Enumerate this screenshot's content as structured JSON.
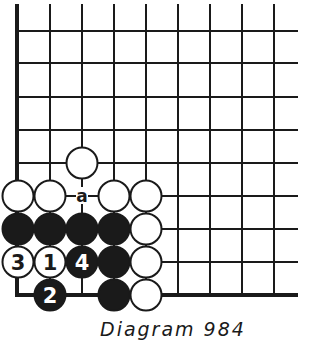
{
  "diagram": {
    "caption": "Diagram 984",
    "colors": {
      "ink": "#1a1a1a",
      "paper": "#ffffff"
    },
    "grid": {
      "x_lines": [
        17,
        50,
        82,
        114,
        146,
        178,
        210,
        242,
        274
      ],
      "y_lines": [
        31,
        63,
        97,
        130,
        163,
        196,
        229,
        262,
        295
      ],
      "top": 4,
      "right": 298,
      "left_edge_x": 17,
      "bottom_edge_y": 295
    },
    "stone_radius": 16,
    "stones": [
      {
        "color": "white",
        "col": 2,
        "row": 4,
        "label": ""
      },
      {
        "color": "white",
        "col": 0,
        "row": 5,
        "label": ""
      },
      {
        "color": "white",
        "col": 1,
        "row": 5,
        "label": ""
      },
      {
        "color": "white",
        "col": 3,
        "row": 5,
        "label": ""
      },
      {
        "color": "white",
        "col": 4,
        "row": 5,
        "label": ""
      },
      {
        "color": "black",
        "col": 0,
        "row": 6,
        "label": ""
      },
      {
        "color": "black",
        "col": 1,
        "row": 6,
        "label": ""
      },
      {
        "color": "black",
        "col": 2,
        "row": 6,
        "label": ""
      },
      {
        "color": "black",
        "col": 3,
        "row": 6,
        "label": ""
      },
      {
        "color": "white",
        "col": 4,
        "row": 6,
        "label": ""
      },
      {
        "color": "white",
        "col": 0,
        "row": 7,
        "label": "3"
      },
      {
        "color": "white",
        "col": 1,
        "row": 7,
        "label": "1"
      },
      {
        "color": "black",
        "col": 2,
        "row": 7,
        "label": "4"
      },
      {
        "color": "black",
        "col": 3,
        "row": 7,
        "label": ""
      },
      {
        "color": "white",
        "col": 4,
        "row": 7,
        "label": ""
      },
      {
        "color": "black",
        "col": 1,
        "row": 8,
        "label": "2"
      },
      {
        "color": "black",
        "col": 3,
        "row": 8,
        "label": ""
      },
      {
        "color": "white",
        "col": 4,
        "row": 8,
        "label": ""
      }
    ],
    "markers": [
      {
        "col": 2,
        "row": 5,
        "label": "a"
      }
    ]
  }
}
